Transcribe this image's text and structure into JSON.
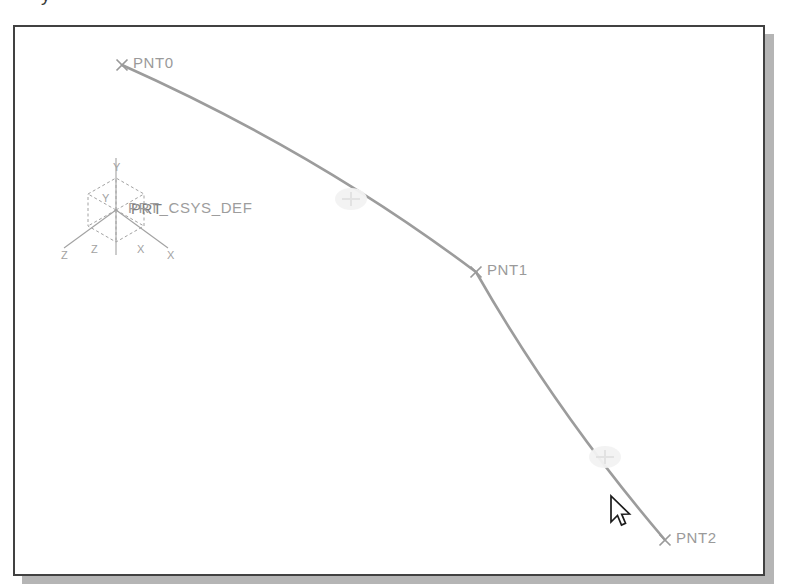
{
  "application": {
    "kind": "cad-3d-graphics-window",
    "background_color": "#ffffff",
    "border_color": "#414141",
    "shadow_color": "#a8a8a8"
  },
  "top_clipped_text": "y",
  "viewport": {
    "width": 752,
    "height": 551,
    "geometry_color": "#9c9c9c",
    "highlight_color": "#f2f2f2",
    "datum_point_color": "#9a9a9a",
    "csys_color": "#a2a2a2"
  },
  "datum_points": [
    {
      "id": "pnt0",
      "label": "PNT0",
      "marker": "x",
      "x": 107,
      "y": 38,
      "label_x": 118,
      "label_y": 27
    },
    {
      "id": "pnt1",
      "label": "PNT1",
      "marker": "x",
      "x": 461,
      "y": 245,
      "label_x": 472,
      "label_y": 234
    },
    {
      "id": "pnt2",
      "label": "PNT2",
      "marker": "x",
      "x": 650,
      "y": 513,
      "label_x": 661,
      "label_y": 502
    }
  ],
  "curve": {
    "name": "datum-curve-through-points",
    "type": "polyline-spline",
    "vertices": [
      {
        "x": 107,
        "y": 38
      },
      {
        "x": 461,
        "y": 245
      },
      {
        "x": 650,
        "y": 513
      }
    ],
    "segment_highlight_markers": [
      {
        "name": "segment-midpoint-marker-1",
        "x": 336,
        "y": 172
      },
      {
        "name": "segment-midpoint-marker-2",
        "x": 590,
        "y": 430
      }
    ]
  },
  "coordinate_system": {
    "name": "PRT_CSYS_DEF",
    "label": "PRT_CSYS_DEF",
    "overlap_label": "PRT",
    "label_x": 113,
    "label_y": 172,
    "origin_x": 101,
    "origin_y": 183,
    "axis_labels": [
      {
        "letter": "Y",
        "x": 98,
        "y": 134
      },
      {
        "letter": "Y",
        "x": 87,
        "y": 165
      },
      {
        "letter": "Z",
        "x": 46,
        "y": 222
      },
      {
        "letter": "Z",
        "x": 76,
        "y": 216
      },
      {
        "letter": "X",
        "x": 152,
        "y": 222
      },
      {
        "letter": "X",
        "x": 122,
        "y": 216
      }
    ]
  },
  "cursor": {
    "name": "arrow-pointer",
    "x": 593,
    "y": 467,
    "fill": "#ffffff",
    "stroke": "#1c1c1c"
  }
}
